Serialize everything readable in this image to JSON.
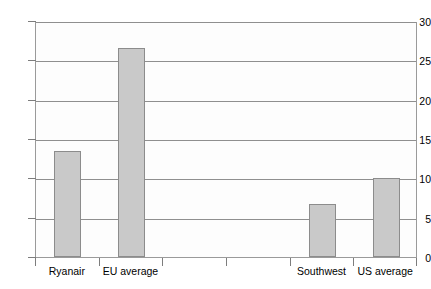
{
  "chart_data": {
    "type": "bar",
    "title": "",
    "subtitle": "",
    "xlabel": "",
    "ylabel": "",
    "categories": [
      "Ryanair",
      "EU average",
      "",
      "",
      "Southwest",
      "US average"
    ],
    "values": [
      13.5,
      26.6,
      null,
      null,
      6.8,
      10.1
    ],
    "series": [
      {
        "name": "",
        "values": [
          13.5,
          26.6,
          null,
          null,
          6.8,
          10.1
        ]
      }
    ],
    "ylim": [
      0,
      30
    ],
    "yticks": [
      0,
      5,
      10,
      15,
      20,
      25,
      30
    ],
    "ytick_labels": [
      "0",
      "5",
      "10",
      "15",
      "20",
      "25",
      "30"
    ],
    "grid": true,
    "legend": false,
    "legend_position": "none",
    "annotations": [],
    "colors": {
      "bar_fill": "#c9c9c9",
      "bar_stroke": "#8c8c8c",
      "gridline": "#8f8f8f",
      "axis": "#9a9a9a",
      "plot_background": "#fdfdfd",
      "text": "#000000"
    }
  },
  "axis": {
    "y_ticks": [
      {
        "value": 30,
        "label": "30"
      },
      {
        "value": 25,
        "label": "25"
      },
      {
        "value": 20,
        "label": "20"
      },
      {
        "value": 15,
        "label": "15"
      },
      {
        "value": 10,
        "label": "10"
      },
      {
        "value": 5,
        "label": "5"
      },
      {
        "value": 0,
        "label": "0"
      }
    ],
    "x_categories": [
      {
        "label": "Ryanair",
        "value": 13.5
      },
      {
        "label": "EU average",
        "value": 26.6
      },
      {
        "label": "",
        "value": null
      },
      {
        "label": "",
        "value": null
      },
      {
        "label": "Southwest",
        "value": 6.8
      },
      {
        "label": "US average",
        "value": 10.1
      }
    ]
  }
}
